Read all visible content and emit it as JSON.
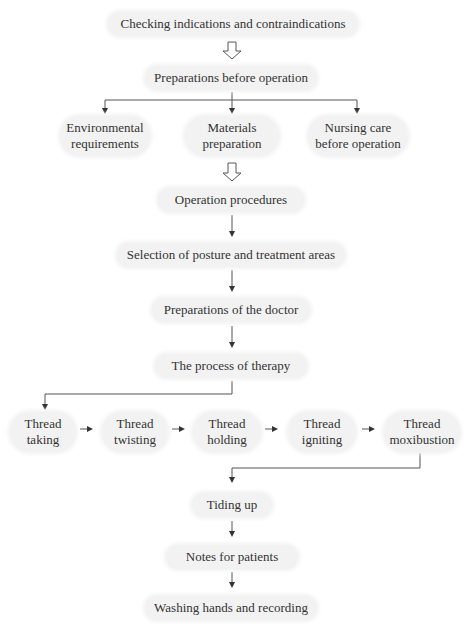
{
  "flowchart": {
    "step1": "Checking indications and contraindications",
    "step2": "Preparations before operation",
    "prep_branches": [
      {
        "line1": "Environmental",
        "line2": "requirements"
      },
      {
        "line1": "Materials",
        "line2": "preparation"
      },
      {
        "line1": "Nursing care",
        "line2": "before operation"
      }
    ],
    "step3": "Operation procedures",
    "step4": "Selection of posture and treatment areas",
    "step5": "Preparations of the doctor",
    "step6": "The process of therapy",
    "thread_steps": [
      {
        "line1": "Thread",
        "line2": "taking"
      },
      {
        "line1": "Thread",
        "line2": "twisting"
      },
      {
        "line1": "Thread",
        "line2": "holding"
      },
      {
        "line1": "Thread",
        "line2": "igniting"
      },
      {
        "line1": "Thread",
        "line2": "moxibustion"
      }
    ],
    "step7": "Tiding up",
    "step8": "Notes for patients",
    "step9": "Washing hands and recording"
  },
  "colors": {
    "box_fill": "#f2f2f2",
    "arrow": "#333333",
    "text": "#333333"
  }
}
